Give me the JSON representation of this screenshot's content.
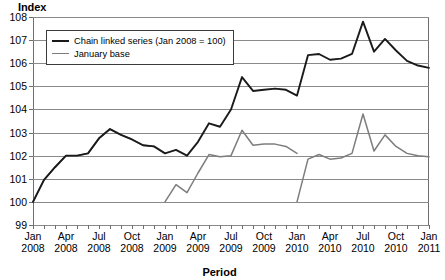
{
  "chart_data": {
    "type": "line",
    "title": "",
    "ylabel": "Index",
    "xlabel": "Period",
    "ylim": [
      99,
      108
    ],
    "yticks": [
      99,
      100,
      101,
      102,
      103,
      104,
      105,
      106,
      107,
      108
    ],
    "grid": true,
    "legend_position": "upper-left-inside",
    "x": [
      "Jan 2008",
      "Feb 2008",
      "Mar 2008",
      "Apr 2008",
      "May 2008",
      "Jun 2008",
      "Jul 2008",
      "Aug 2008",
      "Sep 2008",
      "Oct 2008",
      "Nov 2008",
      "Dec 2008",
      "Jan 2009",
      "Feb 2009",
      "Mar 2009",
      "Apr 2009",
      "May 2009",
      "Jun 2009",
      "Jul 2009",
      "Aug 2009",
      "Sep 2009",
      "Oct 2009",
      "Nov 2009",
      "Dec 2009",
      "Jan 2010",
      "Feb 2010",
      "Mar 2010",
      "Apr 2010",
      "May 2010",
      "Jun 2010",
      "Jul 2010",
      "Aug 2010",
      "Sep 2010",
      "Oct 2010",
      "Nov 2010",
      "Dec 2010",
      "Jan 2011"
    ],
    "tick_labels": [
      {
        "top": "Jan",
        "bottom": "2008"
      },
      {
        "top": "Apr",
        "bottom": "2008"
      },
      {
        "top": "Jul",
        "bottom": "2008"
      },
      {
        "top": "Oct",
        "bottom": "2008"
      },
      {
        "top": "Jan",
        "bottom": "2009"
      },
      {
        "top": "Apr",
        "bottom": "2009"
      },
      {
        "top": "Jul",
        "bottom": "2009"
      },
      {
        "top": "Oct",
        "bottom": "2009"
      },
      {
        "top": "Jan",
        "bottom": "2010"
      },
      {
        "top": "Apr",
        "bottom": "2010"
      },
      {
        "top": "Jul",
        "bottom": "2010"
      },
      {
        "top": "Oct",
        "bottom": "2010"
      },
      {
        "top": "Jan",
        "bottom": "2011"
      }
    ],
    "series": [
      {
        "name": "Chain linked series (Jan 2008 = 100)",
        "color": "#1a1a1a",
        "width": 1.9,
        "values": [
          100.0,
          100.95,
          101.5,
          102.0,
          102.0,
          102.1,
          102.75,
          103.15,
          102.9,
          102.7,
          102.45,
          102.4,
          102.1,
          102.25,
          102.0,
          102.6,
          103.4,
          103.25,
          104.0,
          105.4,
          104.8,
          104.85,
          104.9,
          104.85,
          104.6,
          106.35,
          106.4,
          106.15,
          106.2,
          106.4,
          107.8,
          106.5,
          107.05,
          106.55,
          106.1,
          105.9,
          105.8
        ]
      },
      {
        "name": "January base",
        "color": "#7d7d7d",
        "width": 1.5,
        "segments": [
          {
            "start_index": 0,
            "values": [
              100.0,
              100.95,
              101.5,
              102.0,
              102.0,
              102.1,
              102.75,
              103.15,
              102.9,
              102.7,
              102.45,
              102.4
            ]
          },
          {
            "start_index": 12,
            "values": [
              100.0,
              100.75,
              100.4,
              101.25,
              102.05,
              101.95,
              102.0,
              103.1,
              102.45,
              102.5,
              102.5,
              102.4,
              102.1
            ]
          },
          {
            "start_index": 24,
            "values": [
              100.0,
              101.85,
              102.05,
              101.85,
              101.9,
              102.1,
              103.8,
              102.2,
              102.9,
              102.4,
              102.1,
              102.0,
              101.95
            ]
          }
        ]
      }
    ]
  },
  "legend": {
    "items": [
      {
        "label": "Chain linked series (Jan 2008 = 100)"
      },
      {
        "label": "January base"
      }
    ]
  }
}
